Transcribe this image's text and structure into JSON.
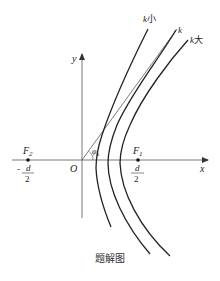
{
  "diagram": {
    "type": "hyperbola-family",
    "axes": {
      "x_label": "x",
      "y_label": "y",
      "origin_label": "O"
    },
    "foci": [
      {
        "name": "F",
        "sub": "2",
        "position_label_sign": "-",
        "position_num": "d",
        "position_den": "2"
      },
      {
        "name": "F",
        "sub": "1",
        "position_label_sign": "",
        "position_num": "d",
        "position_den": "2"
      }
    ],
    "curves": [
      {
        "label_var": "k",
        "label_suffix": "小"
      },
      {
        "label_var": "k",
        "label_suffix": ""
      },
      {
        "label_var": "k",
        "label_suffix": "大"
      }
    ],
    "angle": {
      "symbol": "φ",
      "sub": "k"
    },
    "caption": "题解图"
  }
}
